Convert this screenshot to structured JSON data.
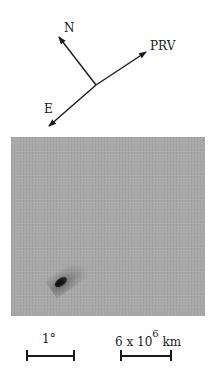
{
  "compass": {
    "north_label": "N",
    "east_label": "E",
    "velocity_label": "PRV"
  },
  "photo": {
    "description": "Grayscale photograph of a comet with short tail",
    "background_color": "#a9a9a9",
    "nucleus_color": "#111111"
  },
  "scale_bars": {
    "angular": {
      "label": "1°"
    },
    "linear": {
      "label_mantissa": "6 x 10",
      "label_exponent": "6",
      "label_unit": "km"
    }
  }
}
